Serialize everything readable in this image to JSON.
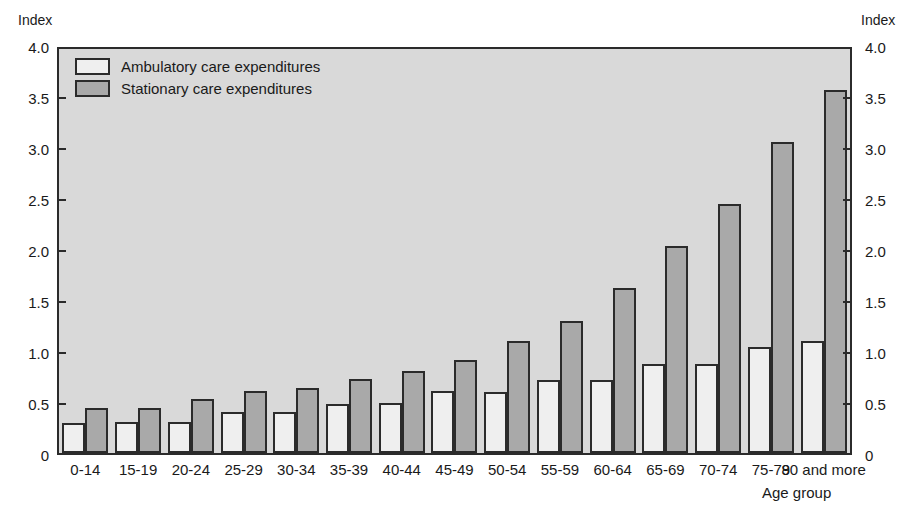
{
  "chart_data": {
    "type": "bar",
    "title": "",
    "xlabel": "Age group",
    "ylabel": "Index",
    "ylabel_right": "Index",
    "ylim": [
      0,
      4.0
    ],
    "yticks": [
      "0",
      "0.5",
      "1.0",
      "1.5",
      "2.0",
      "2.5",
      "3.0",
      "3.5",
      "4.0"
    ],
    "ytick_values": [
      0,
      0.5,
      1.0,
      1.5,
      2.0,
      2.5,
      3.0,
      3.5,
      4.0
    ],
    "grid": false,
    "legend_position": "top-left",
    "categories": [
      "0-14",
      "15-19",
      "20-24",
      "25-29",
      "30-34",
      "35-39",
      "40-44",
      "45-49",
      "50-54",
      "55-59",
      "60-64",
      "65-69",
      "70-74",
      "75-79",
      "80 and more"
    ],
    "series": [
      {
        "name": "Ambulatory care expenditures",
        "color": "#efefef",
        "values": [
          0.3,
          0.31,
          0.31,
          0.41,
          0.41,
          0.49,
          0.5,
          0.61,
          0.6,
          0.72,
          0.72,
          0.88,
          0.88,
          1.05,
          1.11
        ]
      },
      {
        "name": "Stationary care expenditures",
        "color": "#a9a9a9",
        "values": [
          0.45,
          0.45,
          0.53,
          0.61,
          0.64,
          0.73,
          0.81,
          0.92,
          1.11,
          1.31,
          1.63,
          2.05,
          2.47,
          3.08,
          3.59
        ]
      }
    ]
  },
  "colors": {
    "plot_background": "#d9d9d9",
    "page_background": "#ffffff",
    "axis": "#2b2b2b",
    "ambulatory": "#efefef",
    "stationary": "#a9a9a9"
  }
}
